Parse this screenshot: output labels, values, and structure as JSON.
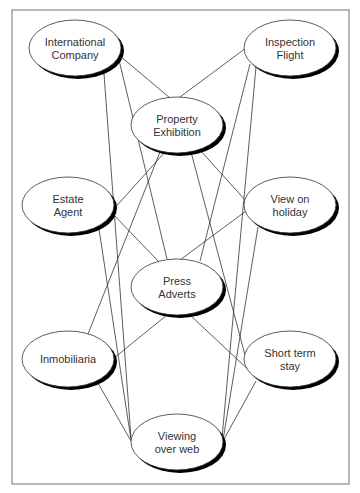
{
  "diagram": {
    "type": "network",
    "frame": {
      "x": 12,
      "y": 10,
      "width": 337,
      "height": 474,
      "stroke": "#8a8a8a"
    },
    "nodes": [
      {
        "id": "international-company",
        "lines": [
          "International",
          "Company"
        ],
        "cx": 75,
        "cy": 48,
        "rx": 46,
        "ry": 28
      },
      {
        "id": "inspection-flight",
        "lines": [
          "Inspection",
          "Flight"
        ],
        "cx": 290,
        "cy": 48,
        "rx": 46,
        "ry": 28
      },
      {
        "id": "property-exhibition",
        "lines": [
          "Property",
          "Exhibition"
        ],
        "cx": 177,
        "cy": 125,
        "rx": 46,
        "ry": 28
      },
      {
        "id": "estate-agent",
        "lines": [
          "Estate",
          "Agent"
        ],
        "cx": 68,
        "cy": 205,
        "rx": 46,
        "ry": 28
      },
      {
        "id": "view-on-holiday",
        "lines": [
          "View on",
          "holiday"
        ],
        "cx": 290,
        "cy": 205,
        "rx": 46,
        "ry": 28
      },
      {
        "id": "press-adverts",
        "lines": [
          "Press",
          "Adverts"
        ],
        "cx": 177,
        "cy": 287,
        "rx": 46,
        "ry": 28
      },
      {
        "id": "inmobiliaria",
        "lines": [
          "Inmobiliaria"
        ],
        "cx": 68,
        "cy": 359,
        "rx": 46,
        "ry": 28
      },
      {
        "id": "short-term-stay",
        "lines": [
          "Short term",
          "stay"
        ],
        "cx": 290,
        "cy": 359,
        "rx": 46,
        "ry": 28
      },
      {
        "id": "viewing-over-web",
        "lines": [
          "Viewing",
          "over web"
        ],
        "cx": 177,
        "cy": 442,
        "rx": 46,
        "ry": 28
      }
    ],
    "edges": [
      {
        "from": "international-company",
        "to": "press-adverts",
        "x1": 118,
        "y1": 56,
        "x2": 167,
        "y2": 259
      },
      {
        "from": "international-company",
        "to": "property-exhibition",
        "x1": 120,
        "y1": 56,
        "x2": 170,
        "y2": 98
      },
      {
        "from": "international-company",
        "to": "viewing-over-web",
        "x1": 104,
        "y1": 74,
        "x2": 131,
        "y2": 438
      },
      {
        "from": "inspection-flight",
        "to": "property-exhibition",
        "x1": 246,
        "y1": 48,
        "x2": 180,
        "y2": 97
      },
      {
        "from": "inspection-flight",
        "to": "press-adverts",
        "x1": 250,
        "y1": 64,
        "x2": 200,
        "y2": 261
      },
      {
        "from": "inspection-flight",
        "to": "viewing-over-web",
        "x1": 256,
        "y1": 67,
        "x2": 222,
        "y2": 438
      },
      {
        "from": "property-exhibition",
        "to": "estate-agent",
        "x1": 165,
        "y1": 152,
        "x2": 112,
        "y2": 211
      },
      {
        "from": "property-exhibition",
        "to": "inmobiliaria",
        "x1": 160,
        "y1": 152,
        "x2": 88,
        "y2": 334
      },
      {
        "from": "property-exhibition",
        "to": "view-on-holiday",
        "x1": 200,
        "y1": 150,
        "x2": 246,
        "y2": 201
      },
      {
        "from": "property-exhibition",
        "to": "short-term-stay",
        "x1": 191,
        "y1": 152,
        "x2": 249,
        "y2": 370
      },
      {
        "from": "estate-agent",
        "to": "press-adverts",
        "x1": 112,
        "y1": 213,
        "x2": 160,
        "y2": 263
      },
      {
        "from": "estate-agent",
        "to": "viewing-over-web",
        "x1": 99,
        "y1": 229,
        "x2": 131,
        "y2": 440
      },
      {
        "from": "view-on-holiday",
        "to": "press-adverts",
        "x1": 246,
        "y1": 211,
        "x2": 180,
        "y2": 260
      },
      {
        "from": "view-on-holiday",
        "to": "viewing-over-web",
        "x1": 258,
        "y1": 227,
        "x2": 223,
        "y2": 440
      },
      {
        "from": "press-adverts",
        "to": "inmobiliaria",
        "x1": 167,
        "y1": 315,
        "x2": 114,
        "y2": 358
      },
      {
        "from": "press-adverts",
        "to": "short-term-stay",
        "x1": 190,
        "y1": 315,
        "x2": 254,
        "y2": 375
      },
      {
        "from": "inmobiliaria",
        "to": "viewing-over-web",
        "x1": 98,
        "y1": 383,
        "x2": 131,
        "y2": 441
      },
      {
        "from": "short-term-stay",
        "to": "viewing-over-web",
        "x1": 256,
        "y1": 381,
        "x2": 223,
        "y2": 441
      }
    ]
  }
}
